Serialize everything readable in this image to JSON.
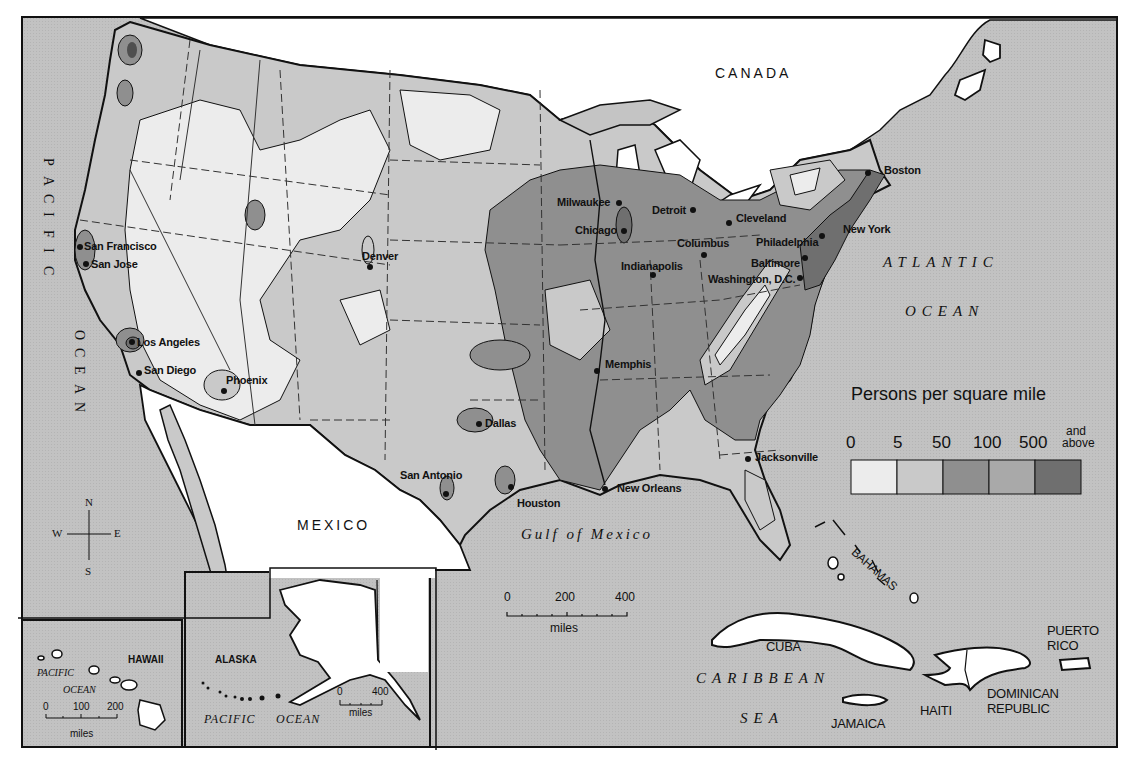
{
  "map": {
    "title": "Persons per square mile",
    "legend": {
      "title": "Persons per square mile",
      "breaks": [
        "0",
        "5",
        "50",
        "100",
        "500"
      ],
      "last_label_line1": "and",
      "last_label_line2": "above",
      "classes": [
        {
          "range": "0-5",
          "color": "#ececec"
        },
        {
          "range": "5-50",
          "color": "#c8c8c8"
        },
        {
          "range": "50-100",
          "color": "#8f8f8f"
        },
        {
          "range": "100-500",
          "color": "#a9a9a9"
        },
        {
          "range": "500 and above",
          "color": "#6f6f6f"
        }
      ]
    },
    "colors": {
      "water": "#c4c4c4",
      "foreign_land": "#ffffff",
      "border": "#111111"
    },
    "countries": {
      "canada": "CANADA",
      "mexico": "MEXICO",
      "cuba": "CUBA",
      "jamaica": "JAMAICA",
      "haiti": "HAITI",
      "dominican_line1": "DOMINICAN",
      "dominican_line2": "REPUBLIC",
      "puerto_line1": "PUERTO",
      "puerto_line2": "RICO",
      "bahamas": "BAHAMAS"
    },
    "water_bodies": {
      "pacific": "PACIFIC",
      "ocean_west": "OCEAN",
      "atlantic": "ATLANTIC",
      "atlantic_ocean": "OCEAN",
      "gulf": "Gulf of Mexico",
      "caribbean": "CARIBBEAN",
      "sea": "SEA"
    },
    "cities": [
      {
        "name": "San Francisco",
        "x": 80,
        "y": 245
      },
      {
        "name": "San Jose",
        "x": 87,
        "y": 264
      },
      {
        "name": "Los Angeles",
        "x": 133,
        "y": 343
      },
      {
        "name": "San Diego",
        "x": 139,
        "y": 374
      },
      {
        "name": "Phoenix",
        "x": 224,
        "y": 390
      },
      {
        "name": "Denver",
        "x": 370,
        "y": 267
      },
      {
        "name": "Dallas",
        "x": 479,
        "y": 424
      },
      {
        "name": "San Antonio",
        "x": 446,
        "y": 493
      },
      {
        "name": "Houston",
        "x": 511,
        "y": 487
      },
      {
        "name": "New Orleans",
        "x": 605,
        "y": 489
      },
      {
        "name": "Memphis",
        "x": 597,
        "y": 369
      },
      {
        "name": "Milwaukee",
        "x": 619,
        "y": 203
      },
      {
        "name": "Chicago",
        "x": 624,
        "y": 231
      },
      {
        "name": "Detroit",
        "x": 693,
        "y": 210
      },
      {
        "name": "Cleveland",
        "x": 729,
        "y": 223
      },
      {
        "name": "Columbus",
        "x": 704,
        "y": 255
      },
      {
        "name": "Indianapolis",
        "x": 653,
        "y": 275
      },
      {
        "name": "Philadelphia",
        "x": 822,
        "y": 236
      },
      {
        "name": "Baltimore",
        "x": 805,
        "y": 258
      },
      {
        "name": "Washington, D.C.",
        "x": 800,
        "y": 278
      },
      {
        "name": "New York",
        "x": 840,
        "y": 232
      },
      {
        "name": "Boston",
        "x": 877,
        "y": 172
      },
      {
        "name": "Jacksonville",
        "x": 748,
        "y": 458
      }
    ],
    "compass": {
      "n": "N",
      "s": "S",
      "e": "E",
      "w": "W"
    },
    "scale_main": {
      "labels": [
        "0",
        "200",
        "400"
      ],
      "unit": "miles"
    },
    "inset_hawaii": {
      "title": "HAWAII",
      "ocean1": "PACIFIC",
      "ocean2": "OCEAN",
      "scale_labels": [
        "0",
        "100",
        "200"
      ],
      "unit": "miles"
    },
    "inset_alaska": {
      "title": "ALASKA",
      "ocean1": "PACIFIC",
      "ocean2": "OCEAN",
      "scale_labels": [
        "0",
        "400"
      ],
      "unit": "miles"
    }
  }
}
